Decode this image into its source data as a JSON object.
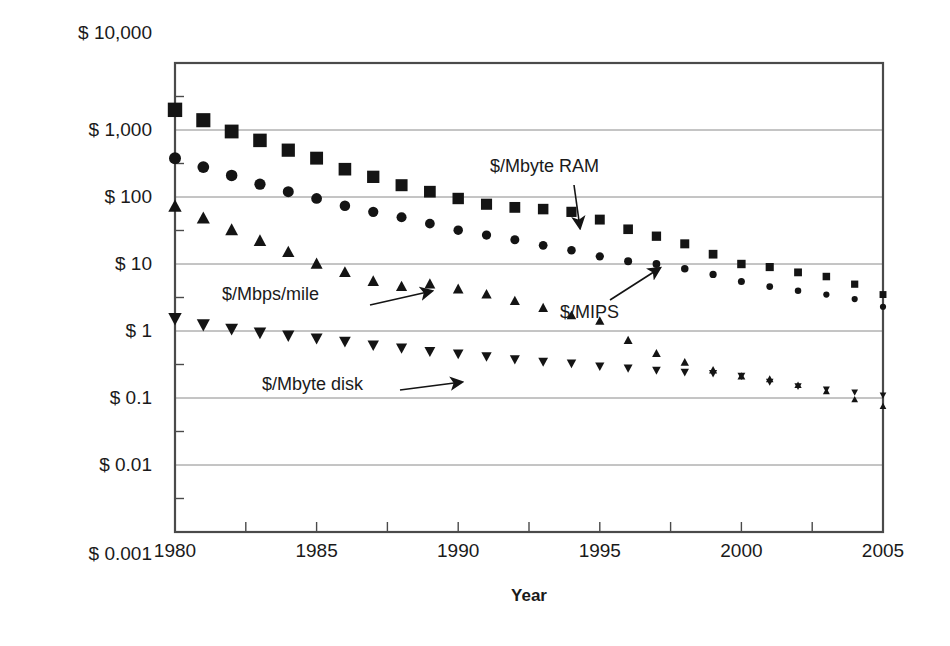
{
  "chart_data": {
    "type": "scatter",
    "title": "",
    "xlabel": "Year",
    "ylabel": "",
    "xlim": [
      1980,
      2005
    ],
    "ylim": [
      0.001,
      10000
    ],
    "yscale": "log",
    "grid": true,
    "legend_position": "inline-annotations",
    "xticks": [
      1980,
      1985,
      1990,
      1995,
      2000,
      2005
    ],
    "xticklabels": [
      "1980",
      "1985",
      "1990",
      "1995",
      "2000",
      "2005"
    ],
    "yticks": [
      0.001,
      0.01,
      0.1,
      1,
      10,
      100,
      1000,
      10000
    ],
    "yticklabels": [
      "$ 0.001",
      "$ 0.01",
      "$ 0.1",
      "$ 1",
      "$ 10",
      "$ 100",
      "$ 1,000",
      "$ 10,000"
    ],
    "x": [
      1980,
      1981,
      1982,
      1983,
      1984,
      1985,
      1986,
      1987,
      1988,
      1989,
      1990,
      1991,
      1992,
      1993,
      1994,
      1995,
      1996,
      1997,
      1998,
      1999,
      2000,
      2001,
      2002,
      2003,
      2004,
      2005
    ],
    "series": [
      {
        "name": "$/Mbyte RAM",
        "marker": "square",
        "values": [
          2000,
          1400,
          950,
          700,
          500,
          380,
          260,
          200,
          150,
          120,
          95,
          78,
          70,
          66,
          60,
          46,
          33,
          26,
          20,
          14,
          10,
          9,
          7.5,
          6.5,
          5,
          3.5
        ]
      },
      {
        "name": "$/MIPS",
        "marker": "circle",
        "values": [
          380,
          280,
          210,
          155,
          120,
          95,
          74,
          60,
          50,
          40,
          32,
          27,
          23,
          19,
          16,
          13,
          11,
          10,
          8.5,
          7,
          5.5,
          4.6,
          4,
          3.5,
          3,
          2.3
        ]
      },
      {
        "name": "$/Mbps/mile",
        "marker": "triangle-up",
        "values": [
          72,
          48,
          32,
          22,
          15,
          10,
          7.5,
          5.5,
          4.6,
          5.0,
          4.2,
          3.5,
          2.8,
          2.2,
          1.7,
          1.4,
          0.72,
          0.46,
          0.34,
          0.26,
          0.21,
          0.19,
          0.155,
          0.125,
          0.095,
          0.075
        ]
      },
      {
        "name": "$/Mbyte disk",
        "marker": "triangle-down",
        "values": [
          1.55,
          1.25,
          1.08,
          0.95,
          0.86,
          0.78,
          0.7,
          0.62,
          0.56,
          0.5,
          0.46,
          0.42,
          0.38,
          0.35,
          0.33,
          0.3,
          0.28,
          0.26,
          0.245,
          0.235,
          0.215,
          0.175,
          0.15,
          0.135,
          0.122,
          0.11
        ]
      }
    ],
    "annotations": [
      {
        "id": "ram",
        "text": "$/Mbyte RAM",
        "text_x": 490,
        "text_y": 172,
        "arrow_from_x": 574,
        "arrow_from_y": 185,
        "arrow_to_x": 580,
        "arrow_to_y": 228
      },
      {
        "id": "mips",
        "text": "$/MIPS",
        "text_x": 560,
        "text_y": 318,
        "arrow_from_x": 610,
        "arrow_from_y": 300,
        "arrow_to_x": 660,
        "arrow_to_y": 268
      },
      {
        "id": "mbps",
        "text": "$/Mbps/mile",
        "text_x": 222,
        "text_y": 300,
        "arrow_from_x": 370,
        "arrow_from_y": 305,
        "arrow_to_x": 432,
        "arrow_to_y": 291
      },
      {
        "id": "disk",
        "text": "$/Mbyte disk",
        "text_x": 262,
        "text_y": 390,
        "arrow_from_x": 400,
        "arrow_from_y": 390,
        "arrow_to_x": 462,
        "arrow_to_y": 382
      }
    ],
    "colors": {
      "marker": "#141414",
      "grid": "#8a8a8a",
      "frame": "#4a4a4a",
      "text": "#1a1a1a"
    }
  },
  "axis": {
    "x_title": "Year"
  },
  "plot_geometry": {
    "left": 175,
    "right": 883,
    "top": 63,
    "bottom": 532
  }
}
